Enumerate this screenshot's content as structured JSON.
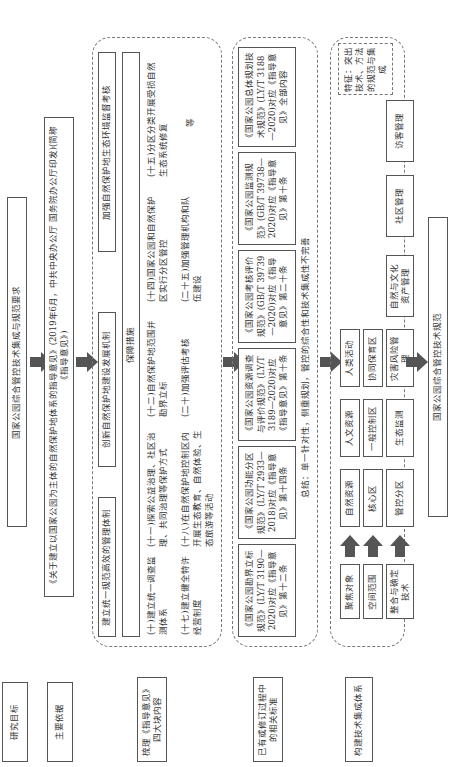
{
  "row_labels": {
    "goal": "研究目标",
    "basis": "主要依据",
    "review": "梳理《指导意见》四大块内容",
    "standards": "已有或修订过程中的相关标准",
    "system": "构建技术集成体系"
  },
  "goal_box": "国家公园综合管控技术集成与规范要求",
  "basis_box": "《关于建立以国家公园为主体的自然保护地体系的指导意见》(2019年6月，中共中央办公厅 国务院办公厅印发)(简称《指导意见》)",
  "review": {
    "headers": [
      "建立统一规范高效的管理体制",
      "创新自然保护地建设发展机制",
      "加强自然保护地生态环境监督考核"
    ],
    "subheader": "保障措施",
    "items": [
      "(十)建立统一调查监测体系",
      "(十一)探索公益治理、社区治理、共同治理等保护方式",
      "(十二)自然保护地范围并勘界立标",
      "(十四)国家公园和自然保护区实行分区管控",
      "(十五)分区分类开展受损自然生态系统修复",
      "(十七)建立健全特许经营制度",
      "(十八)在自然保护地控制区内开展生态教育、自然体验、生态旅游等活动",
      "(二十)加强评估考核",
      "(二十五)加强管理机构和队伍建设"
    ],
    "etc": "等"
  },
  "standards": {
    "items": [
      "《国家公园勘界立标规范》(LY/T 3190—2020)对应《指导意见》第十二条",
      "《国家公园功能分区规范》(LY/T 2933—2018)对应《指导意见》第十四条",
      "《国家公园资源调查与评价规范》(LY/T 3189—2020)对应《指导意见》第十条",
      "《国家公园考核评价规范》(GB/T 39739—2020)对应《指导意见》第二十条",
      "《国家公园监测规范》(GB/T 39738—2020)对应《指导意见》第十条",
      "《国家公园总体规划技术规范》(LY/T 3188—2020)对应《指导意见》全部内容"
    ],
    "summary": "总结：单一针对性，侧重规划，管控的综合性和技术集成性不完善"
  },
  "system": {
    "left": [
      "聚焦对象",
      "空间范围",
      "整合与确定技术"
    ],
    "row1": [
      "自然资源",
      "人文资源",
      "人类活动"
    ],
    "row2": [
      "核心区",
      "一般控制区",
      "协同保育区"
    ],
    "row3": [
      "管控分区",
      "生态监测",
      "灾害风险管理",
      "自然与文化资产管理",
      "社区管理",
      "访客管理"
    ],
    "feature": "特征：突出技术、方法的规范与集成"
  },
  "result_box": "国家公园综合管控技术规范"
}
